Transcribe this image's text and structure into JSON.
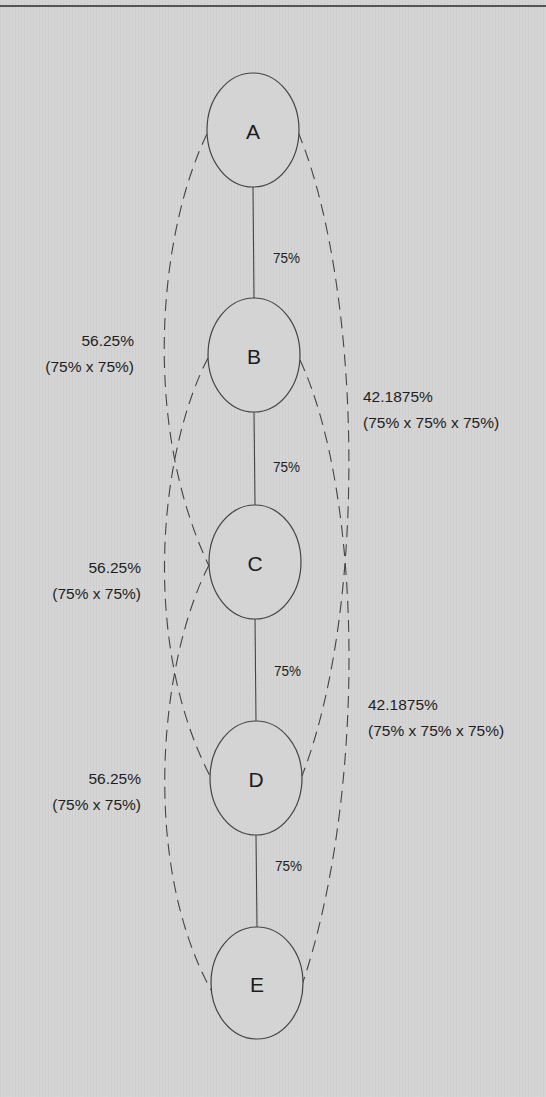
{
  "diagram": {
    "type": "node-chain-probability",
    "colors": {
      "background": "#d4d4d4",
      "stroke": "#444444",
      "text": "#1e1e1e"
    },
    "nodes": [
      {
        "id": "A",
        "label": "A",
        "cx": 253,
        "cy": 130,
        "rx": 46,
        "ry": 57
      },
      {
        "id": "B",
        "label": "B",
        "cx": 254,
        "cy": 355,
        "rx": 46,
        "ry": 57
      },
      {
        "id": "C",
        "label": "C",
        "cx": 255,
        "cy": 562,
        "rx": 46,
        "ry": 57
      },
      {
        "id": "D",
        "label": "D",
        "cx": 256,
        "cy": 778,
        "rx": 46,
        "ry": 57
      },
      {
        "id": "E",
        "label": "E",
        "cx": 257,
        "cy": 983,
        "rx": 46,
        "ry": 56
      }
    ],
    "direct_edges": [
      {
        "from": "A",
        "to": "B",
        "label": "75%",
        "lx": 273,
        "ly": 263
      },
      {
        "from": "B",
        "to": "C",
        "label": "75%",
        "lx": 273,
        "ly": 472
      },
      {
        "from": "C",
        "to": "D",
        "label": "75%",
        "lx": 274,
        "ly": 676
      },
      {
        "from": "D",
        "to": "E",
        "label": "75%",
        "lx": 275,
        "ly": 871
      }
    ],
    "indirect_edges": [
      {
        "from": "A",
        "to": "C",
        "side": "left",
        "d": "M 207 134 C 160 230, 140 420, 209 566"
      },
      {
        "from": "B",
        "to": "D",
        "side": "left",
        "d": "M 208 358 C 160 450, 140 640, 210 776"
      },
      {
        "from": "C",
        "to": "E",
        "side": "left",
        "d": "M 209 565 C 160 660, 140 860, 211 990"
      },
      {
        "from": "A",
        "to": "D",
        "side": "right",
        "d": "M 298 132 C 360 280, 370 600, 302 776"
      },
      {
        "from": "B",
        "to": "E",
        "side": "right",
        "d": "M 300 360 C 365 500, 365 800, 302 985"
      }
    ],
    "annotations": [
      {
        "id": "left-1",
        "value": "56.25%",
        "formula": "(75% x 75%)",
        "anchor": "end",
        "x": 134,
        "y1": 346,
        "y2": 372
      },
      {
        "id": "left-2",
        "value": "56.25%",
        "formula": "(75% x 75%)",
        "anchor": "end",
        "x": 141,
        "y1": 573,
        "y2": 599
      },
      {
        "id": "left-3",
        "value": "56.25%",
        "formula": "(75% x 75%)",
        "anchor": "end",
        "x": 141,
        "y1": 784,
        "y2": 810
      },
      {
        "id": "right-1",
        "value": "42.1875%",
        "formula": "(75% x 75% x 75%)",
        "anchor": "start",
        "x": 363,
        "y1": 402,
        "y2": 428
      },
      {
        "id": "right-2",
        "value": "42.1875%",
        "formula": "(75% x 75% x 75%)",
        "anchor": "start",
        "x": 368,
        "y1": 710,
        "y2": 736
      }
    ]
  }
}
